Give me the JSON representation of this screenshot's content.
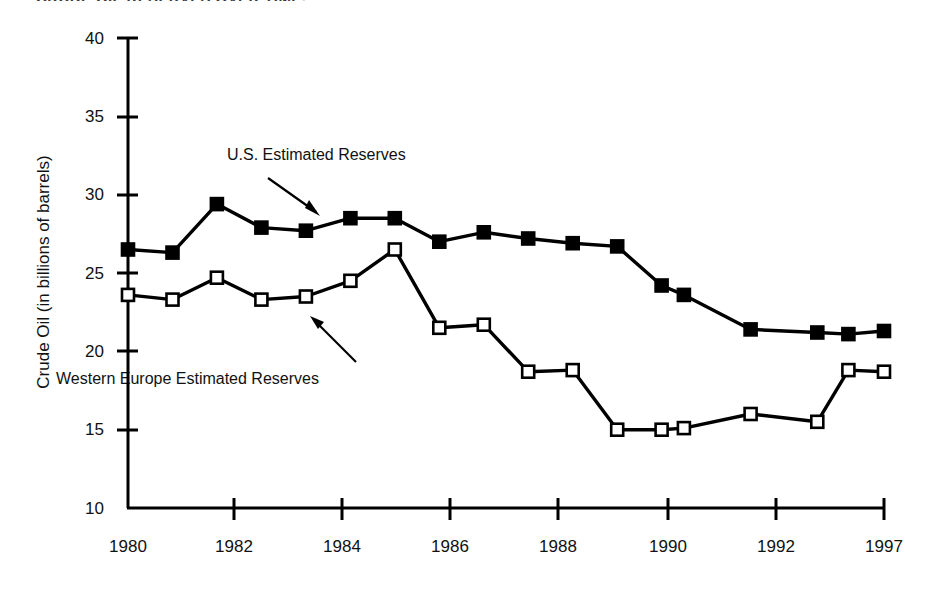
{
  "chart_data": {
    "type": "line",
    "title": "CRUDE OIL RESERVES OVER TIME.",
    "xlabel": "",
    "ylabel": "Crude Oil (in billions of barrels)",
    "ylim": [
      10,
      40
    ],
    "yticks": [
      10,
      15,
      20,
      25,
      30,
      35,
      40
    ],
    "xlim": [
      1980,
      1997
    ],
    "xticks": [
      1980,
      1982,
      1984,
      1986,
      1988,
      1990,
      1992,
      1997
    ],
    "xtick_labels": [
      "1980",
      "1982",
      "1984",
      "1986",
      "1988",
      "1990",
      "1992",
      "1997"
    ],
    "grid": false,
    "legend": "annotations-with-arrows",
    "series": [
      {
        "name": "U.S. Estimated Reserves",
        "marker": "filled-square",
        "color": "#000000",
        "x": [
          1980,
          1981,
          1982,
          1983,
          1984,
          1985,
          1986,
          1987,
          1988,
          1989,
          1990,
          1991,
          1992,
          1992.5,
          1994,
          1995.5,
          1996.2,
          1997
        ],
        "values": [
          26.5,
          26.3,
          29.4,
          27.9,
          27.7,
          28.5,
          28.5,
          27.0,
          27.6,
          27.2,
          26.9,
          26.7,
          24.2,
          23.6,
          21.4,
          21.2,
          21.1,
          21.3
        ]
      },
      {
        "name": "Western Europe Estimated Reserves",
        "marker": "open-square",
        "color": "#000000",
        "x": [
          1980,
          1981,
          1982,
          1983,
          1984,
          1985,
          1986,
          1987,
          1988,
          1989,
          1990,
          1991,
          1992,
          1992.5,
          1994,
          1995.5,
          1996.2,
          1997
        ],
        "values": [
          23.6,
          23.3,
          24.7,
          23.3,
          23.5,
          24.5,
          26.5,
          21.5,
          21.7,
          18.7,
          18.8,
          15.0,
          15.0,
          15.1,
          16.0,
          15.5,
          18.8,
          18.7
        ]
      }
    ],
    "annotations": [
      {
        "text": "U.S. Estimated Reserves",
        "label_x_px": 227,
        "label_y_px": 154,
        "arrow_from_px": [
          268,
          178
        ],
        "arrow_to_px": [
          318,
          215
        ]
      },
      {
        "text": "Western Europe Estimated Reserves",
        "label_x_px": 56,
        "label_y_px": 378,
        "arrow_from_px": [
          352,
          360
        ],
        "arrow_to_px": [
          312,
          318
        ]
      }
    ]
  },
  "axis": {
    "y_labels": [
      "40",
      "35",
      "30",
      "25",
      "20",
      "15",
      "10"
    ],
    "x_labels": [
      "1980",
      "1982",
      "1984",
      "1986",
      "1988",
      "1990",
      "1992",
      "1997"
    ],
    "y_title": "Crude Oil (in billions of barrels)"
  },
  "labels": {
    "us_series": "U.S. Estimated Reserves",
    "we_series": "Western Europe Estimated Reserves",
    "title": "CRUDE OIL RESERVES OVER TIME."
  }
}
